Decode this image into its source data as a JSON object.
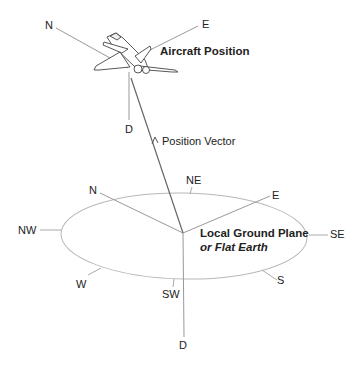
{
  "diagram": {
    "aircraft": {
      "label": "Aircraft Position",
      "axes": {
        "north": "N",
        "east": "E",
        "down": "D"
      }
    },
    "vector": {
      "label": "Position Vector"
    },
    "ground_plane": {
      "label_line1": "Local Ground Plane",
      "label_line2": "or Flat Earth",
      "axes": {
        "north": "N",
        "east": "E",
        "down": "D"
      },
      "compass": {
        "ne": "NE",
        "se": "SE",
        "s": "S",
        "sw": "SW",
        "w": "W",
        "nw": "NW"
      }
    },
    "colors": {
      "line": "#9a9a9a",
      "vector": "#555555",
      "text": "#222222"
    }
  }
}
